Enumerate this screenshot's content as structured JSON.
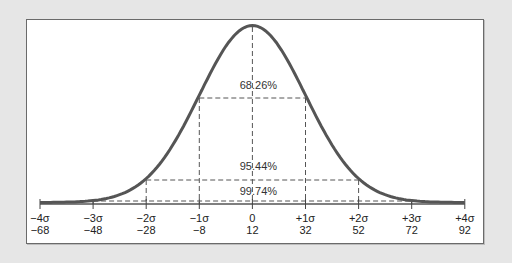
{
  "chart_data": {
    "type": "line",
    "xlabel": "",
    "ylabel": "",
    "mean": 12,
    "sd": 20,
    "grid": false,
    "legend": null,
    "x_ticks": [
      {
        "sigma": "−4σ",
        "value": "−68"
      },
      {
        "sigma": "−3σ",
        "value": "−48"
      },
      {
        "sigma": "−2σ",
        "value": "−28"
      },
      {
        "sigma": "−1σ",
        "value": "−8"
      },
      {
        "sigma": "0",
        "value": "12"
      },
      {
        "sigma": "+1σ",
        "value": "32"
      },
      {
        "sigma": "+2σ",
        "value": "52"
      },
      {
        "sigma": "+3σ",
        "value": "72"
      },
      {
        "sigma": "+4σ",
        "value": "92"
      }
    ],
    "x": [
      -68,
      -48,
      -28,
      -8,
      12,
      32,
      52,
      72,
      92
    ],
    "xlim": [
      -68,
      92
    ],
    "annotations": [
      {
        "label": "68.26%",
        "range_sigma": [
          -1,
          1
        ],
        "range_values": [
          -8,
          32
        ]
      },
      {
        "label": "95.44%",
        "range_sigma": [
          -2,
          2
        ],
        "range_values": [
          -28,
          52
        ]
      },
      {
        "label": "99.74%",
        "range_sigma": [
          -3,
          3
        ],
        "range_values": [
          -48,
          72
        ]
      }
    ]
  },
  "colors": {
    "curve": "#555555",
    "dashed": "#555555",
    "background": "#e6e6e6",
    "panel": "#ffffff"
  }
}
